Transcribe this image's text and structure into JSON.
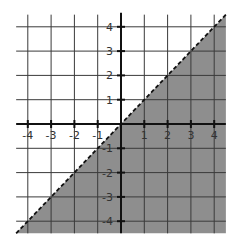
{
  "chart_data": {
    "type": "area",
    "title": "",
    "inequality": "y < x",
    "boundary": {
      "equation": "y = x",
      "style": "dashed",
      "slope": 1,
      "intercept": 0
    },
    "shaded_region": "below",
    "xlim": [
      -4.5,
      4.5
    ],
    "ylim": [
      -4.5,
      4.5
    ],
    "grid": true,
    "xlabel": "",
    "ylabel": "",
    "x_ticks": [
      -4,
      -3,
      -2,
      -1,
      1,
      2,
      3,
      4
    ],
    "y_ticks": [
      4,
      3,
      2,
      1,
      -1,
      -2,
      -3,
      -4
    ],
    "x_tick_labels": [
      "-4",
      "-3",
      "-2",
      "-1",
      "1",
      "2",
      "3",
      "4"
    ],
    "y_tick_labels": [
      "4",
      "3",
      "2",
      "1",
      "-1",
      "-2",
      "-3",
      "-4"
    ],
    "line_points": {
      "x": [
        -4.5,
        4.5
      ],
      "y": [
        -4.5,
        4.5
      ]
    }
  },
  "colors": {
    "shade": "#8e8e8e",
    "grid": "#3a3a3a",
    "axis": "#111111",
    "boundary": "#111111"
  }
}
